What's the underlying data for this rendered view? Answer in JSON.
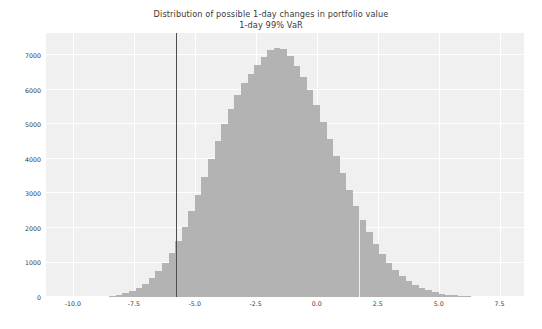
{
  "chart_data": {
    "type": "bar",
    "title": "Distribution of possible 1-day changes in portfolio value",
    "subtitle": "1-day 99% VaR",
    "xlabel": "",
    "ylabel": "",
    "xlim": [
      -11.1,
      8.5
    ],
    "ylim": [
      0,
      7650
    ],
    "grid": true,
    "legend": null,
    "bar_color": "#b3b3b3",
    "plot_background": "#f0f0f0",
    "gridline_color": "#ffffff",
    "annotation_line": {
      "name": "1-day 99% VaR",
      "orientation": "vertical",
      "x": -5.75,
      "color": "#4d4d4d"
    },
    "xticks": [
      -10.0,
      -7.5,
      -5.0,
      -2.5,
      0.0,
      2.5,
      5.0,
      7.5
    ],
    "xtick_labels": [
      "-10.0",
      "-7.5",
      "-5.0",
      "-2.5",
      "0.0",
      "2.5",
      "5.0",
      "7.5"
    ],
    "yticks": [
      0,
      1000,
      2000,
      3000,
      4000,
      5000,
      6000,
      7000
    ],
    "ytick_labels": [
      "0",
      "1000",
      "2000",
      "3000",
      "4000",
      "5000",
      "6000",
      "7000"
    ],
    "bin_width": 0.27,
    "x": [
      -8.37,
      -8.1,
      -7.83,
      -7.56,
      -7.29,
      -7.02,
      -6.75,
      -6.48,
      -6.21,
      -5.94,
      -5.67,
      -5.4,
      -5.13,
      -4.86,
      -4.59,
      -4.32,
      -4.05,
      -3.78,
      -3.51,
      -3.24,
      -2.97,
      -2.7,
      -2.43,
      -2.16,
      -1.89,
      -1.62,
      -1.35,
      -1.08,
      -0.81,
      -0.54,
      -0.27,
      0.0,
      0.27,
      0.54,
      0.81,
      1.08,
      1.35,
      1.62,
      1.89,
      2.16,
      2.43,
      2.7,
      2.97,
      3.24,
      3.51,
      3.78,
      4.05,
      4.32,
      4.59,
      4.86,
      5.13,
      5.4,
      5.67,
      5.94,
      6.21
    ],
    "values": [
      30,
      60,
      110,
      175,
      260,
      380,
      540,
      740,
      980,
      1280,
      1630,
      2030,
      2480,
      2960,
      3470,
      3990,
      4510,
      5000,
      5460,
      5860,
      6200,
      6470,
      6720,
      6950,
      7150,
      7230,
      7200,
      6980,
      6700,
      6380,
      6000,
      5560,
      5080,
      4580,
      4080,
      3580,
      3100,
      2650,
      2240,
      1870,
      1540,
      1250,
      1000,
      790,
      615,
      470,
      355,
      260,
      190,
      135,
      95,
      65,
      45,
      28,
      16
    ]
  }
}
